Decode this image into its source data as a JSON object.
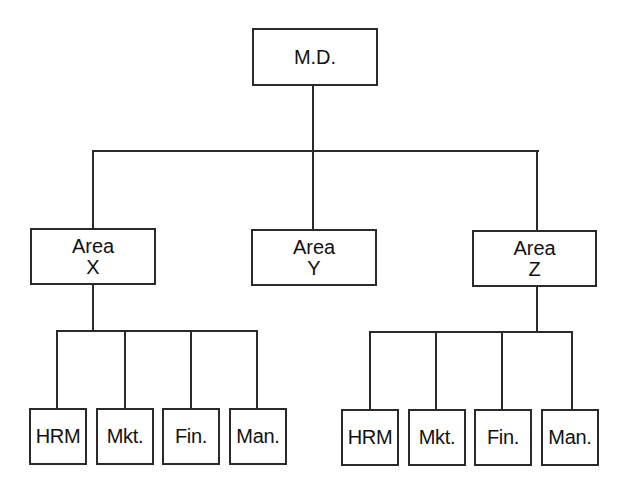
{
  "diagram": {
    "type": "org-chart",
    "root": {
      "label": "M.D."
    },
    "areas": [
      {
        "line1": "Area",
        "line2": "X",
        "departments": [
          "HRM",
          "Mkt.",
          "Fin.",
          "Man."
        ]
      },
      {
        "line1": "Area",
        "line2": "Y",
        "departments": []
      },
      {
        "line1": "Area",
        "line2": "Z",
        "departments": [
          "HRM",
          "Mkt.",
          "Fin.",
          "Man."
        ]
      }
    ],
    "line_color": "#2a2a2a"
  }
}
